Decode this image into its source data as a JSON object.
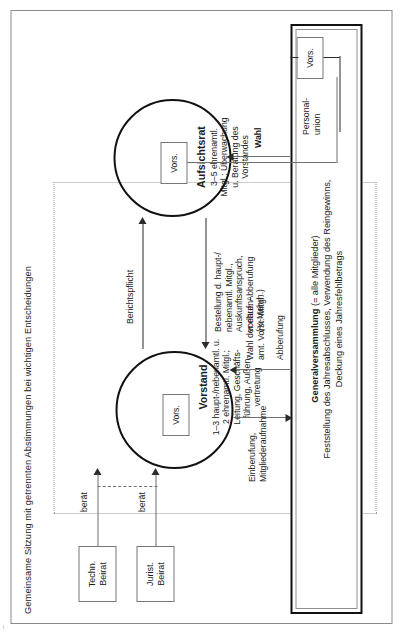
{
  "page": {
    "group_title": "Gemeinsame Sitzung mit getrennten Abstimmungen bei wichtigen Entscheidungen",
    "page_mark": "~"
  },
  "advisory_boards": [
    {
      "id": "techn",
      "label": "Techn.\nBeirat",
      "edge_label": "berät"
    },
    {
      "id": "jurist",
      "label": "Jurist.\nBeirat",
      "edge_label": "berät"
    }
  ],
  "organs": {
    "vorstand": {
      "name": "Vorstand",
      "description": "1–3 haupt-/nebenamtl. u.\n2 ehrenamtl. Mitgl.;\nLeitung, Geschäfts-\nführung, Außen-\nvertretung",
      "chair_label": "Vors."
    },
    "aufsichtsrat": {
      "name": "Aufsichtsrat",
      "description": "3–5 ehrenamtl.\nMitgl.; Überwachung\nu. Beratung des\nVorstandes",
      "chair_label": "Vors."
    },
    "generalversammlung": {
      "name": "Generalversammlung",
      "qualifier": " (= alle Mitglieder)",
      "description": "Feststellung des Jahresabschlusses, Verwendung des Reingewinns,\nDeckung eines Jahresfehlbetrags",
      "chair_label": "Vors."
    }
  },
  "edges": {
    "berichtspflicht": "Berichtspflicht",
    "bestellung": "Bestellung d. haupt-/\nnebenamtl. Mitgl.,\nAuskunftsanspruch,\nvorläuf. Abberufung\n(¾-Mehrh.)",
    "einberufung": "Einberufung,\nMitgliederaufnahme",
    "wahl_vorst": "Wahl der ehren-\namt. Vorst.-Mitgl.",
    "abberufung": "Abberufung",
    "wahl": "Wahl",
    "personalunion": "Personal-\nunion"
  },
  "colors": {
    "ink": "#1a1a1a",
    "line": "#6f6f6f",
    "line_dark": "#2b2b2b",
    "frame": "#8a8a8a",
    "dotted": "#9a9a9a",
    "background": "#ffffff"
  }
}
